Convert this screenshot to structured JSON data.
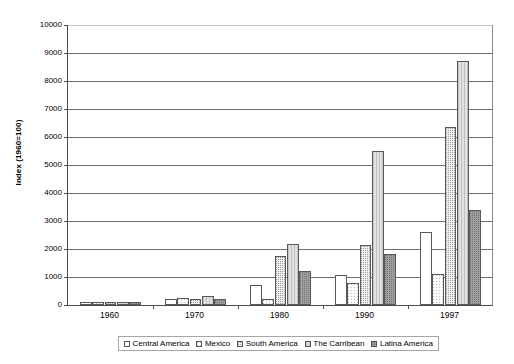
{
  "chart_data": {
    "type": "bar",
    "title": "",
    "subtitle": "",
    "xlabel": "",
    "ylabel": "Index (1960=100)",
    "categories": [
      "1960",
      "1970",
      "1980",
      "1990",
      "1997"
    ],
    "series": [
      {
        "name": "Central America",
        "values": [
          100,
          220,
          720,
          1080,
          2600
        ]
      },
      {
        "name": "Mexico",
        "values": [
          100,
          250,
          230,
          780,
          1100
        ]
      },
      {
        "name": "South America",
        "values": [
          100,
          200,
          1740,
          2150,
          6350
        ]
      },
      {
        "name": "The Carribean",
        "values": [
          100,
          310,
          2180,
          5500,
          8700
        ]
      },
      {
        "name": "Latina America",
        "values": [
          100,
          230,
          1220,
          1810,
          3380
        ]
      }
    ],
    "ylim": [
      0,
      10000
    ],
    "ytick_values": [
      0,
      1000,
      2000,
      3000,
      4000,
      5000,
      6000,
      7000,
      8000,
      9000,
      10000
    ],
    "ytick_labels": [
      "0",
      "1000",
      "2000",
      "3000",
      "4000",
      "5000",
      "6000",
      "7000",
      "8000",
      "9000",
      "10000"
    ],
    "grid": true,
    "grid_axis": "y",
    "legend_position": "bottom",
    "series_colors": [
      "#ffffff",
      "#fbfbfb",
      "#eeeeee",
      "#e2e2e2",
      "#9e9e9e"
    ]
  },
  "legend": {
    "items": [
      {
        "label": "Central America"
      },
      {
        "label": "Mexico"
      },
      {
        "label": "South America"
      },
      {
        "label": "The Carribean"
      },
      {
        "label": "Latina America"
      }
    ]
  }
}
